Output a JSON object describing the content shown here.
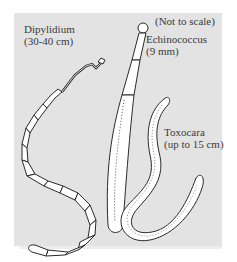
{
  "figure": {
    "background_color": "#e3e3e3",
    "note": "(Not to scale)",
    "specimens": [
      {
        "name": "Dipylidium",
        "size": "(30-40 cm)"
      },
      {
        "name": "Echinococcus",
        "size": "(9 mm)"
      },
      {
        "name": "Toxocara",
        "size": "(up to 15 cm)"
      }
    ]
  }
}
